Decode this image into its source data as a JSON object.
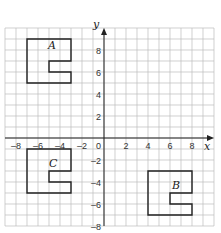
{
  "chart_data": {
    "type": "coordinate-grid",
    "xlabel": "x",
    "ylabel": "y",
    "xlim": [
      -9,
      10
    ],
    "ylim": [
      -8,
      10
    ],
    "x_ticks": [
      "-8",
      "-6",
      "-4",
      "-2",
      "2",
      "4",
      "6",
      "8"
    ],
    "y_ticks": [
      "8",
      "6",
      "4",
      "2",
      "0",
      "-2",
      "-4",
      "-6",
      "-8"
    ],
    "shapes": [
      {
        "name": "A",
        "vertices": [
          [
            -7,
            9
          ],
          [
            -3,
            9
          ],
          [
            -3,
            7
          ],
          [
            -5,
            7
          ],
          [
            -5,
            6
          ],
          [
            -3,
            6
          ],
          [
            -3,
            5
          ],
          [
            -7,
            5
          ]
        ]
      },
      {
        "name": "B",
        "vertices": [
          [
            4,
            -3
          ],
          [
            8,
            -3
          ],
          [
            8,
            -5
          ],
          [
            6,
            -5
          ],
          [
            6,
            -6
          ],
          [
            8,
            -6
          ],
          [
            8,
            -7
          ],
          [
            4,
            -7
          ]
        ]
      },
      {
        "name": "C",
        "vertices": [
          [
            -7,
            -1
          ],
          [
            -3,
            -1
          ],
          [
            -3,
            -3
          ],
          [
            -5,
            -3
          ],
          [
            -5,
            -4
          ],
          [
            -3,
            -4
          ],
          [
            -3,
            -5
          ],
          [
            -7,
            -5
          ]
        ]
      }
    ]
  },
  "labels": {
    "x_axis": "x",
    "y_axis": "y",
    "A": "A",
    "B": "B",
    "C": "C",
    "origin": "0"
  }
}
